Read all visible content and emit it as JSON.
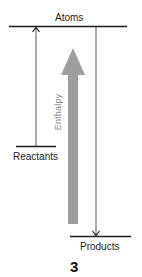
{
  "diagram": {
    "type": "enthalpy-level-diagram",
    "levels": [
      {
        "id": "atoms",
        "label": "Atoms"
      },
      {
        "id": "reactants",
        "label": "Reactants"
      },
      {
        "id": "products",
        "label": "Products"
      }
    ],
    "axis_label": "Enthalpy",
    "arrows": [
      {
        "from": "reactants",
        "to": "atoms",
        "direction": "up"
      },
      {
        "from": "atoms",
        "to": "products",
        "direction": "down"
      }
    ],
    "figure_number": "3",
    "colors": {
      "line": "#1a1a1a",
      "enthalpy_arrow": "#9e9e9e",
      "enthalpy_text": "#8a8a8a"
    }
  }
}
